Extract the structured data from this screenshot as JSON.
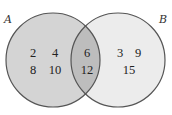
{
  "diagram": {
    "type": "venn",
    "sets": [
      {
        "name": "A",
        "only": [
          "2",
          "4",
          "8",
          "10"
        ]
      },
      {
        "name": "B",
        "only": [
          "3",
          "9",
          "15"
        ]
      }
    ],
    "intersection": [
      "6",
      "12"
    ],
    "colors": {
      "setA_fill": "#d4d4d4",
      "setB_fill": "#ececec",
      "intersection_fill": "#bdbdbd",
      "stroke": "#555555"
    }
  }
}
